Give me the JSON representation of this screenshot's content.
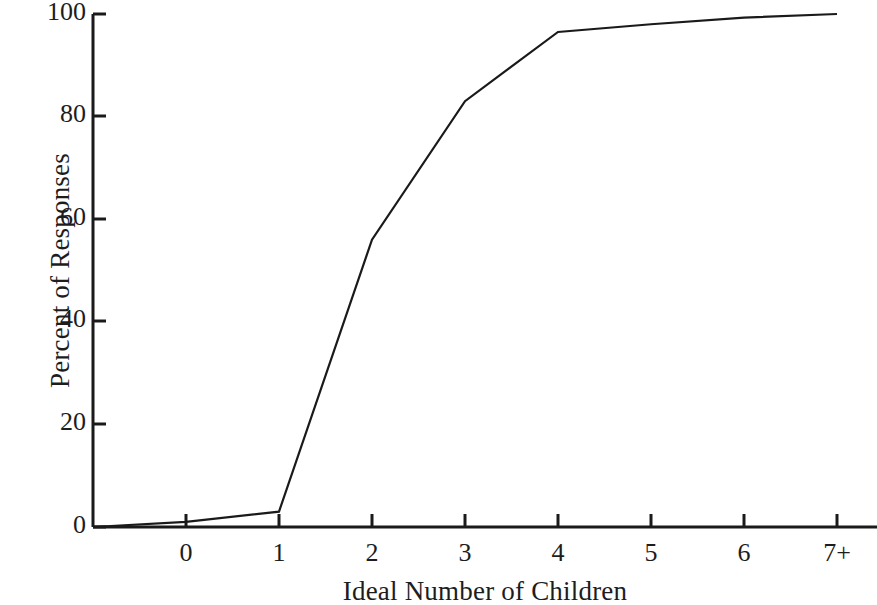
{
  "chart_data": {
    "type": "line",
    "title": "",
    "subtitle": "",
    "xlabel": "Ideal Number of Children",
    "ylabel": "Percent of Responses",
    "categories": [
      "0",
      "1",
      "2",
      "3",
      "4",
      "5",
      "6",
      "7+"
    ],
    "x": [
      0,
      1,
      2,
      3,
      4,
      5,
      6,
      7
    ],
    "values": [
      1,
      3,
      56,
      83,
      96.5,
      98,
      99.3,
      100
    ],
    "series": [
      {
        "name": "Cumulative percent of responses",
        "values": [
          1,
          3,
          56,
          83,
          96.5,
          98,
          99.3,
          100
        ]
      }
    ],
    "xtick_labels": [
      "0",
      "1",
      "2",
      "3",
      "4",
      "5",
      "6",
      "7+"
    ],
    "ytick_labels": [
      "0",
      "20",
      "40",
      "60",
      "80",
      "100"
    ],
    "ytick_values": [
      0,
      20,
      40,
      60,
      80,
      100
    ],
    "ylim": [
      0,
      100
    ],
    "xlim": [
      -0.6,
      7.4
    ],
    "grid": false,
    "legend": false,
    "legend_position": "none",
    "line_color": "#1a1a1a",
    "line_width": 2.2,
    "markers": false,
    "axis_color": "#1a1a1a",
    "background_color": "#ffffff",
    "annotations": [],
    "start_point": {
      "x": -0.6,
      "y": 0
    }
  },
  "geometry": {
    "plot_left": 93,
    "plot_right": 877,
    "plot_top": 14,
    "plot_bottom": 527,
    "x_tick_pixels": [
      186,
      279,
      372,
      465,
      558,
      651,
      744,
      837
    ],
    "y_tick_pixels": [
      527,
      424,
      321,
      219,
      116,
      14
    ]
  }
}
